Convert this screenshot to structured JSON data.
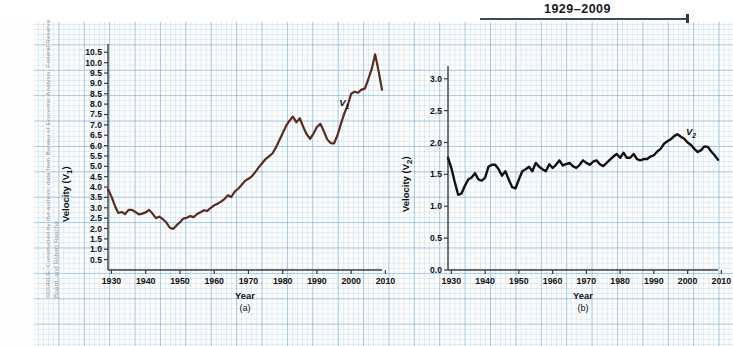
{
  "figure": {
    "title": "1929–2009",
    "source_note": "SOURCE: Constructed by the authors; data from Bureau of Economic Analysis, Federal Reserve Board, and Robert Rasche."
  },
  "chart_data": [
    {
      "type": "line",
      "panel": "(a)",
      "title": "1929–2009",
      "xlabel": "Year",
      "ylabel": "Velocity (V1)",
      "ylabel_display": "Velocity (V",
      "ylabel_sub": "1",
      "series_label": "V",
      "series_label_sub": "1",
      "color": "#5b2c1d",
      "grid": true,
      "legend": "none",
      "xlim": [
        1929,
        2009
      ],
      "ylim": [
        0,
        10.9
      ],
      "xticks": [
        1930,
        1940,
        1950,
        1960,
        1970,
        1980,
        1990,
        2000,
        2010
      ],
      "yticks": [
        0.5,
        1.0,
        1.5,
        2.0,
        2.5,
        3.0,
        3.5,
        4.0,
        4.5,
        5.0,
        5.5,
        6.0,
        6.5,
        7.0,
        7.5,
        8.0,
        8.5,
        9.0,
        9.5,
        10.0,
        10.5
      ],
      "x": [
        1929,
        1930,
        1931,
        1932,
        1933,
        1934,
        1935,
        1936,
        1937,
        1938,
        1939,
        1940,
        1941,
        1942,
        1943,
        1944,
        1945,
        1946,
        1947,
        1948,
        1949,
        1950,
        1951,
        1952,
        1953,
        1954,
        1955,
        1956,
        1957,
        1958,
        1959,
        1960,
        1961,
        1962,
        1963,
        1964,
        1965,
        1966,
        1967,
        1968,
        1969,
        1970,
        1971,
        1972,
        1973,
        1974,
        1975,
        1976,
        1977,
        1978,
        1979,
        1980,
        1981,
        1982,
        1983,
        1984,
        1985,
        1986,
        1987,
        1988,
        1989,
        1990,
        1991,
        1992,
        1993,
        1994,
        1995,
        1996,
        1997,
        1998,
        1999,
        2000,
        2001,
        2002,
        2003,
        2004,
        2005,
        2006,
        2007,
        2008,
        2009
      ],
      "values": [
        3.9,
        3.55,
        3.1,
        2.75,
        2.8,
        2.7,
        2.9,
        2.9,
        2.8,
        2.68,
        2.72,
        2.78,
        2.9,
        2.72,
        2.5,
        2.58,
        2.45,
        2.3,
        2.05,
        1.98,
        2.15,
        2.3,
        2.48,
        2.52,
        2.6,
        2.55,
        2.7,
        2.78,
        2.88,
        2.85,
        3.0,
        3.12,
        3.2,
        3.3,
        3.42,
        3.6,
        3.52,
        3.78,
        3.92,
        4.1,
        4.3,
        4.4,
        4.52,
        4.72,
        4.95,
        5.15,
        5.35,
        5.48,
        5.62,
        5.9,
        6.25,
        6.6,
        6.95,
        7.2,
        7.4,
        7.12,
        7.32,
        6.9,
        6.55,
        6.32,
        6.58,
        6.9,
        7.05,
        6.7,
        6.3,
        6.12,
        6.1,
        6.5,
        7.05,
        7.55,
        7.95,
        8.5,
        8.6,
        8.55,
        8.7,
        8.75,
        9.2,
        9.7,
        10.4,
        9.6,
        8.7
      ]
    },
    {
      "type": "line",
      "panel": "(b)",
      "xlabel": "Year",
      "ylabel": "Velocity (V2)",
      "ylabel_display": "Velocity (V",
      "ylabel_sub": "2",
      "series_label": "V",
      "series_label_sub": "2",
      "color": "#111111",
      "grid": true,
      "legend": "none",
      "xlim": [
        1929,
        2009
      ],
      "ylim": [
        0,
        3.2
      ],
      "xticks": [
        1930,
        1940,
        1950,
        1960,
        1970,
        1980,
        1990,
        2000,
        2010
      ],
      "yticks": [
        0.0,
        0.5,
        1.0,
        1.5,
        2.0,
        2.5,
        3.0
      ],
      "x": [
        1929,
        1930,
        1931,
        1932,
        1933,
        1934,
        1935,
        1936,
        1937,
        1938,
        1939,
        1940,
        1941,
        1942,
        1943,
        1944,
        1945,
        1946,
        1947,
        1948,
        1949,
        1950,
        1951,
        1952,
        1953,
        1954,
        1955,
        1956,
        1957,
        1958,
        1959,
        1960,
        1961,
        1962,
        1963,
        1964,
        1965,
        1966,
        1967,
        1968,
        1969,
        1970,
        1971,
        1972,
        1973,
        1974,
        1975,
        1976,
        1977,
        1978,
        1979,
        1980,
        1981,
        1982,
        1983,
        1984,
        1985,
        1986,
        1987,
        1988,
        1989,
        1990,
        1991,
        1992,
        1993,
        1994,
        1995,
        1996,
        1997,
        1998,
        1999,
        2000,
        2001,
        2002,
        2003,
        2004,
        2005,
        2006,
        2007,
        2008,
        2009
      ],
      "values": [
        1.76,
        1.6,
        1.38,
        1.18,
        1.2,
        1.32,
        1.42,
        1.45,
        1.52,
        1.42,
        1.4,
        1.45,
        1.62,
        1.65,
        1.65,
        1.58,
        1.48,
        1.55,
        1.42,
        1.3,
        1.28,
        1.42,
        1.55,
        1.58,
        1.62,
        1.55,
        1.68,
        1.62,
        1.58,
        1.55,
        1.66,
        1.6,
        1.65,
        1.72,
        1.64,
        1.66,
        1.68,
        1.63,
        1.6,
        1.65,
        1.72,
        1.68,
        1.65,
        1.7,
        1.72,
        1.66,
        1.63,
        1.68,
        1.73,
        1.78,
        1.82,
        1.76,
        1.84,
        1.76,
        1.76,
        1.82,
        1.74,
        1.72,
        1.74,
        1.74,
        1.78,
        1.8,
        1.86,
        1.9,
        1.98,
        2.02,
        2.05,
        2.1,
        2.13,
        2.09,
        2.06,
        2.0,
        1.96,
        1.9,
        1.85,
        1.88,
        1.94,
        1.93,
        1.86,
        1.8,
        1.73
      ]
    }
  ]
}
